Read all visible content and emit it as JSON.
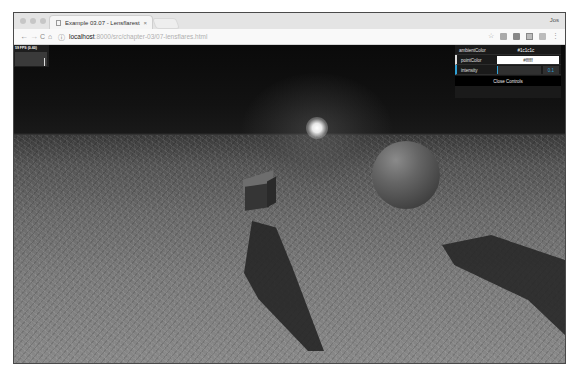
{
  "browser": {
    "tab_title": "Example 03.07 - Lensflarest",
    "tab_close": "×",
    "profile_name": "Jos",
    "url_host": "localhost",
    "url_path": ":8000/src/chapter-03/07-lensflares.html",
    "nav": {
      "back": "←",
      "forward": "→",
      "reload": "C",
      "home": "⌂",
      "info": "ⓘ"
    },
    "toolbar_icons": [
      "star-icon",
      "extension-icon",
      "extension-icon",
      "extension-icon",
      "extension-icon",
      "menu-icon"
    ],
    "star": "☆",
    "menu": "⋮"
  },
  "stats": {
    "fps_label": "59 FPS (0-60)"
  },
  "controls": {
    "ambient": {
      "label": "ambientColor",
      "value": "#1c1c1c"
    },
    "point": {
      "label": "pointColor",
      "value": "#ffffff"
    },
    "intensity": {
      "label": "intensity",
      "value": "0.1"
    },
    "close_label": "Close Controls",
    "accent": "#2fa1d6"
  },
  "scene": {
    "objects": [
      "lens-flare",
      "cube",
      "sphere",
      "grass-ground-plane"
    ]
  }
}
